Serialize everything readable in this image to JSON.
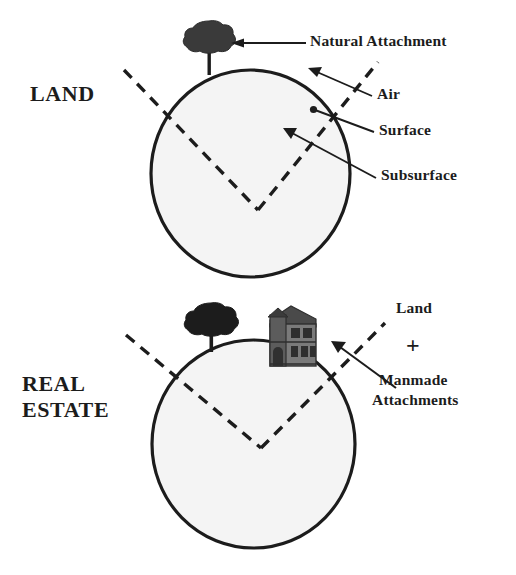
{
  "figure": {
    "title_top": "LAND",
    "title_bottom_line1": "REAL",
    "title_bottom_line2": "ESTATE",
    "colors": {
      "ink": "#1c1c1c",
      "sphere_fill": "#f4f4f4",
      "sphere_stroke": "#1c1c1c",
      "tree_foliage": "#3a3a3a",
      "house_body": "#6f6f6f",
      "house_dark": "#3b3b3b"
    }
  },
  "top_diagram": {
    "name": "land-diagram",
    "labels": [
      {
        "id": "natural-attachment",
        "text": "Natural Attachment"
      },
      {
        "id": "air",
        "text": "Air"
      },
      {
        "id": "surface",
        "text": "Surface"
      },
      {
        "id": "subsurface",
        "text": "Subsurface"
      }
    ],
    "icons": [
      {
        "id": "tree-icon",
        "name": "tree-icon"
      }
    ]
  },
  "bottom_diagram": {
    "name": "real-estate-diagram",
    "labels": [
      {
        "id": "land",
        "text": "Land"
      },
      {
        "id": "plus",
        "text": "+"
      },
      {
        "id": "manmade-1",
        "text": "Manmade"
      },
      {
        "id": "manmade-2",
        "text": "Attachments"
      }
    ],
    "icons": [
      {
        "id": "tree-icon",
        "name": "tree-icon"
      },
      {
        "id": "house-icon",
        "name": "house-icon"
      }
    ]
  }
}
